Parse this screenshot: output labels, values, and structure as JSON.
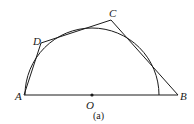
{
  "figure": {
    "caption": "(a)",
    "points": {
      "A": {
        "label": "A",
        "x": 24,
        "y": 95
      },
      "B": {
        "label": "B",
        "x": 178,
        "y": 95
      },
      "C": {
        "label": "C",
        "x": 111,
        "y": 20
      },
      "D": {
        "label": "D",
        "x": 41,
        "y": 43
      },
      "O": {
        "label": "O",
        "x": 92,
        "y": 95
      }
    },
    "semicircle": {
      "center": "O",
      "radius": 67
    },
    "segments": [
      "AB",
      "AD",
      "DC",
      "CB"
    ],
    "colors": {
      "stroke": "#1a1a1a",
      "background": "#ffffff"
    }
  }
}
